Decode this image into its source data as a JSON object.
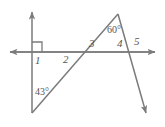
{
  "figure": {
    "stroke_color": "#7b7b7b",
    "text_color": "#555555",
    "background_color": "#ffffff",
    "stroke_width": 1.4
  },
  "angle_labels": [
    {
      "id": "angle-1",
      "text": "1",
      "x": 35,
      "y": 55
    },
    {
      "id": "angle-2",
      "text": "2",
      "x": 63,
      "y": 54
    },
    {
      "id": "angle-3",
      "text": "3",
      "x": 89,
      "y": 39
    },
    {
      "id": "angle-4",
      "text": "4",
      "x": 117,
      "y": 39
    },
    {
      "id": "angle-5",
      "text": "5",
      "x": 134,
      "y": 37
    }
  ],
  "measure_labels": [
    {
      "id": "measure-43",
      "text": "43°",
      "x": 35,
      "y": 87
    },
    {
      "id": "measure-60",
      "text": "60°",
      "x": 107,
      "y": 25
    }
  ],
  "geometry": {
    "horizontal_axis": {
      "x1": 4,
      "y1": 52,
      "x2": 161,
      "y2": 52
    },
    "vertical_axis": {
      "x1": 32,
      "y1": 7,
      "x2": 32,
      "y2": 113
    },
    "right_angle_marker": {
      "x": 32,
      "y": 42,
      "size": 10,
      "quadrant": "upper-right"
    },
    "ray_ascending": {
      "x1": 32,
      "y1": 113,
      "x2": 118,
      "y2": 14
    },
    "ray_descending": {
      "x1": 118,
      "y1": 14,
      "x2": 150,
      "y2": 119
    },
    "crossing_left": {
      "x": 83,
      "y": 52
    },
    "crossing_right": {
      "x": 128,
      "y": 52
    },
    "apex": {
      "x": 118,
      "y": 14
    },
    "arrowheads": [
      {
        "id": "arrow-axis-left",
        "x": 4,
        "y": 52,
        "direction": "left"
      },
      {
        "id": "arrow-axis-right",
        "x": 161,
        "y": 52,
        "direction": "right"
      },
      {
        "id": "arrow-axis-up",
        "x": 32,
        "y": 7,
        "direction": "up"
      },
      {
        "id": "arrow-ray-down",
        "x": 150,
        "y": 119,
        "direction": "down-right"
      }
    ]
  }
}
